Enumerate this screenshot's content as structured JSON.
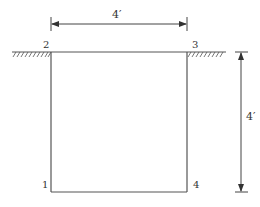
{
  "diagram": {
    "type": "soil-excavation-cross-section",
    "colors": {
      "line": "#555555",
      "text": "#333333",
      "background": "#ffffff"
    },
    "nodes": [
      {
        "id": "1",
        "label": "1",
        "position": "bottom-left"
      },
      {
        "id": "2",
        "label": "2",
        "position": "top-left"
      },
      {
        "id": "3",
        "label": "3",
        "position": "top-right"
      },
      {
        "id": "4",
        "label": "4",
        "position": "bottom-right"
      }
    ],
    "edges": [
      {
        "from": "2",
        "to": "1",
        "kind": "left-wall"
      },
      {
        "from": "1",
        "to": "4",
        "kind": "bottom"
      },
      {
        "from": "4",
        "to": "3",
        "kind": "right-wall"
      },
      {
        "from": "2",
        "to": "3",
        "kind": "ground-surface"
      }
    ],
    "dimensions": {
      "width": {
        "label": "4′",
        "orientation": "horizontal",
        "between": [
          "2",
          "3"
        ]
      },
      "height": {
        "label": "4′",
        "orientation": "vertical",
        "between": [
          "3",
          "4"
        ]
      }
    },
    "ground_hatching": {
      "left": "ground-surface hatch",
      "right": "ground-surface hatch"
    }
  }
}
